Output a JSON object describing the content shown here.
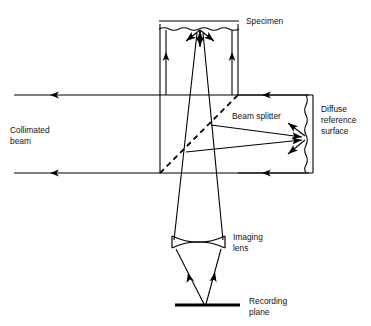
{
  "figure": {
    "type": "optical-ray-diagram",
    "background_color": "#ffffff",
    "line_color": "#000000",
    "text_color": "#111111"
  },
  "labels": {
    "specimen": "Specimen",
    "beam_splitter": "Beam splitter",
    "diffuse_reference_surface_line1": "Diffuse",
    "diffuse_reference_surface_line2": "reference",
    "diffuse_reference_surface_line3": "surface",
    "collimated_beam_line1": "Collimated",
    "collimated_beam_line2": "beam",
    "imaging_lens_line1": "Imaging",
    "imaging_lens_line2": "lens",
    "recording_plane_line1": "Recording",
    "recording_plane_line2": "plane"
  },
  "components": [
    {
      "name": "specimen",
      "kind": "rough-surface",
      "orientation": "horizontal",
      "label": "Specimen"
    },
    {
      "name": "beam-splitter",
      "kind": "dashed-diagonal-plate",
      "orientation": "45-degree",
      "label": "Beam splitter"
    },
    {
      "name": "diffuse-reference-surface",
      "kind": "rough-surface",
      "orientation": "vertical",
      "label": "Diffuse reference surface"
    },
    {
      "name": "imaging-lens",
      "kind": "biconvex-lens",
      "orientation": "horizontal",
      "label": "Imaging lens"
    },
    {
      "name": "recording-plane",
      "kind": "thick-bar",
      "orientation": "horizontal",
      "label": "Recording plane"
    },
    {
      "name": "collimated-beam",
      "kind": "input-rays",
      "orientation": "horizontal",
      "label": "Collimated beam"
    }
  ],
  "geometry": {
    "box_left_x": 160,
    "box_right_x": 313,
    "box_top_y": 95,
    "box_bottom_y": 173,
    "specimen_column_right_x": 238,
    "specimen_y": 23,
    "lens_center_y": 242,
    "lens_left_x": 172,
    "lens_right_x": 225,
    "recording_plane_y": 305,
    "recording_plane_left_x": 175,
    "recording_plane_right_x": 240,
    "beam_splitter_start": [
      160,
      173
    ],
    "beam_splitter_end": [
      238,
      95
    ],
    "reference_surface_x": 310
  }
}
